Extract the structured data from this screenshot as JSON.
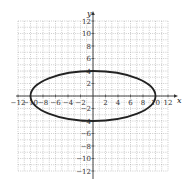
{
  "chart_data": {
    "type": "line",
    "title": "",
    "xlabel": "x",
    "ylabel": "y",
    "xlim": [
      -12,
      12
    ],
    "ylim": [
      -12,
      12
    ],
    "grid": true,
    "grid_style": "dotted",
    "x_ticks": [
      -12,
      -10,
      -8,
      -6,
      -4,
      -2,
      2,
      4,
      6,
      8,
      10,
      12
    ],
    "y_ticks": [
      12,
      10,
      8,
      6,
      4,
      2,
      -2,
      -4,
      -6,
      -8,
      -10,
      -12
    ],
    "x_tick_labels": [
      "−12",
      "−10",
      "−8",
      "−6",
      "−4",
      "−2",
      "2",
      "4",
      "6",
      "8",
      "10",
      "12"
    ],
    "y_tick_labels": [
      "12",
      "10",
      "8",
      "6",
      "4",
      "2",
      "−2",
      "−4",
      "−6",
      "−8",
      "−10",
      "−12"
    ],
    "series": [
      {
        "name": "ellipse",
        "shape": "ellipse",
        "center": [
          0,
          0
        ],
        "semi_major_x": 10,
        "semi_minor_y": 4,
        "equation": "x^2/100 + y^2/16 = 1",
        "points": [
          [
            -10,
            0
          ],
          [
            0,
            4
          ],
          [
            10,
            0
          ],
          [
            0,
            -4
          ]
        ],
        "color": "#222222"
      }
    ]
  },
  "colors": {
    "grid": "#9a9a9a",
    "axis": "#333333",
    "curve": "#222222"
  }
}
